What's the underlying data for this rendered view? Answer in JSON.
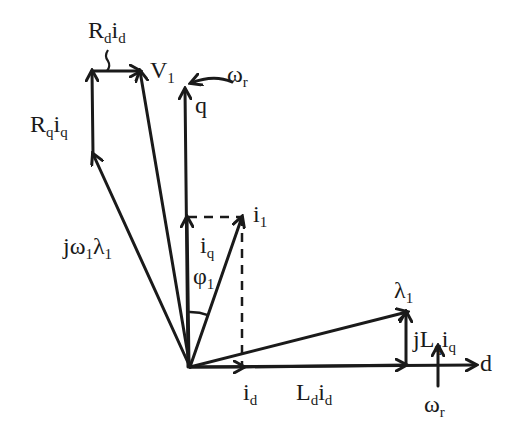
{
  "diagram": {
    "colors": {
      "ink": "#1a1a1a",
      "background": "#ffffff"
    },
    "origin": [
      190,
      367
    ],
    "vectors": [
      {
        "id": "d-axis",
        "from": [
          190,
          367
        ],
        "to": [
          476,
          365
        ],
        "dashed": false
      },
      {
        "id": "q-axis",
        "from": [
          188,
          367
        ],
        "to": [
          185,
          89
        ],
        "dashed": false
      },
      {
        "id": "i_d",
        "from": [
          190,
          367
        ],
        "to": [
          244,
          367
        ],
        "dashed": false
      },
      {
        "id": "i_q",
        "from": [
          189,
          367
        ],
        "to": [
          187,
          217
        ],
        "dashed": false
      },
      {
        "id": "i_1",
        "from": [
          190,
          367
        ],
        "to": [
          242,
          217
        ],
        "dashed": false
      },
      {
        "id": "L_d_i_d",
        "from": [
          244,
          367
        ],
        "to": [
          406,
          365
        ],
        "dashed": false
      },
      {
        "id": "jL_q_i_q",
        "from": [
          406,
          365
        ],
        "to": [
          406,
          312
        ],
        "dashed": false
      },
      {
        "id": "lambda_1",
        "from": [
          190,
          367
        ],
        "to": [
          407,
          312
        ],
        "dashed": false
      },
      {
        "id": "j_omega1_lambda1",
        "from": [
          190,
          367
        ],
        "to": [
          93,
          154
        ],
        "dashed": false
      },
      {
        "id": "R_q_i_q",
        "from": [
          93,
          154
        ],
        "to": [
          92,
          71
        ],
        "dashed": false
      },
      {
        "id": "R_d_i_d",
        "from": [
          92,
          71
        ],
        "to": [
          140,
          71
        ],
        "dashed": false
      },
      {
        "id": "V_1",
        "from": [
          190,
          367
        ],
        "to": [
          140,
          71
        ],
        "dashed": false
      },
      {
        "id": "omega_r_bottom",
        "from": [
          438,
          386
        ],
        "to": [
          438,
          346
        ],
        "dashed": false
      }
    ],
    "dashed_lines": [
      {
        "id": "i_q-to-i_1-projection",
        "from": [
          188,
          217
        ],
        "to": [
          242,
          217
        ]
      },
      {
        "id": "i_1-to-i_d-projection",
        "from": [
          242,
          217
        ],
        "to": [
          242,
          367
        ]
      }
    ],
    "angle_arc": {
      "id": "phi_1",
      "center": [
        190,
        367
      ],
      "radius": 55,
      "start_deg": -91,
      "end_deg": -70
    },
    "curved_arrows": [
      {
        "id": "omega_r_top",
        "path": "M 232 82 Q 214 74 191 83"
      }
    ],
    "labels": [
      {
        "id": "label-R_d-i_d",
        "x": 88,
        "y": 18,
        "main": [
          "R",
          "i"
        ],
        "sub": [
          "d",
          "d"
        ]
      },
      {
        "id": "label-V_1",
        "x": 150,
        "y": 58,
        "main": [
          "V"
        ],
        "sub": [
          "1"
        ]
      },
      {
        "id": "label-omega_r-top",
        "x": 227,
        "y": 62,
        "main": [
          "ω"
        ],
        "sub": [
          "r"
        ]
      },
      {
        "id": "label-q",
        "x": 195,
        "y": 93,
        "main": [
          "q"
        ],
        "sub": []
      },
      {
        "id": "label-R_q-i_q",
        "x": 30,
        "y": 112,
        "main": [
          "R",
          "i"
        ],
        "sub": [
          "q",
          "q"
        ]
      },
      {
        "id": "label-j-omega_1-lambda_1",
        "x": 63,
        "y": 234,
        "main": [
          "jω",
          "λ"
        ],
        "sub": [
          "1",
          "1"
        ]
      },
      {
        "id": "label-i_1",
        "x": 253,
        "y": 202,
        "main": [
          "i"
        ],
        "sub": [
          "1"
        ]
      },
      {
        "id": "label-i_q",
        "x": 200,
        "y": 233,
        "main": [
          "i"
        ],
        "sub": [
          "q"
        ]
      },
      {
        "id": "label-phi_1",
        "x": 193,
        "y": 264,
        "main": [
          "φ"
        ],
        "sub": [
          "1"
        ]
      },
      {
        "id": "label-lambda_1",
        "x": 394,
        "y": 278,
        "main": [
          "λ"
        ],
        "sub": [
          "1"
        ]
      },
      {
        "id": "label-jL_q-i_q",
        "x": 413,
        "y": 327,
        "main": [
          "jL",
          "i"
        ],
        "sub": [
          "q",
          "q"
        ]
      },
      {
        "id": "label-d",
        "x": 480,
        "y": 351,
        "main": [
          "d"
        ],
        "sub": []
      },
      {
        "id": "label-i_d",
        "x": 243,
        "y": 380,
        "main": [
          "i"
        ],
        "sub": [
          "d"
        ]
      },
      {
        "id": "label-L_d-i_d",
        "x": 296,
        "y": 380,
        "main": [
          "L",
          "i"
        ],
        "sub": [
          "d",
          "d"
        ]
      },
      {
        "id": "label-omega_r-bottom",
        "x": 424,
        "y": 392,
        "main": [
          "ω"
        ],
        "sub": [
          "r"
        ]
      }
    ]
  }
}
